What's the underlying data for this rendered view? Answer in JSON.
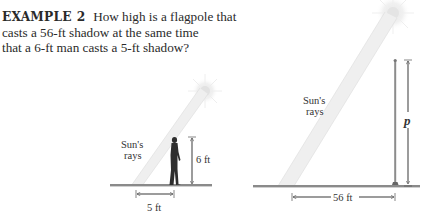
{
  "example": {
    "label": "EXAMPLE",
    "number": "2",
    "lines": [
      "How high is a flagpole that",
      "casts a 56-ft shadow at the same time",
      "that a 6-ft man casts a 5-ft shadow?"
    ]
  },
  "figure_left": {
    "rays_label_1": "Sun's",
    "rays_label_2": "rays",
    "height_label": "6 ft",
    "shadow_label": "5 ft",
    "icons": [
      "sun-icon",
      "man-silhouette-icon"
    ]
  },
  "figure_right": {
    "rays_label_1": "Sun's",
    "rays_label_2": "rays",
    "height_label": "p",
    "shadow_label": "56 ft",
    "icons": [
      "sun-icon",
      "flagpole-icon"
    ]
  },
  "colors": {
    "ground": "#8a8a8a",
    "beam": "#ececec",
    "text": "#2a2a2a",
    "silhouette": "#2e2e2e"
  }
}
